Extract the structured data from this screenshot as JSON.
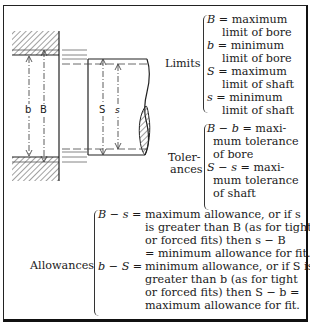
{
  "drawing": {
    "bore_labels": {
      "b": "b",
      "B": "B"
    },
    "shaft_labels": {
      "S": "S",
      "s": "s"
    }
  },
  "limits": {
    "label": "Limits",
    "items": [
      {
        "sym": "B",
        "line1": "= maximum",
        "line2": "limit of bore"
      },
      {
        "sym": "b",
        "line1": "= minimum",
        "line2": "limit of bore"
      },
      {
        "sym": "S",
        "line1": "= maximum",
        "line2": "limit of shaft"
      },
      {
        "sym": "s",
        "line1": "= minimum",
        "line2": "limit of shaft"
      }
    ]
  },
  "tolerances": {
    "label_line1": "Toler-",
    "label_line2": "ances",
    "items": [
      {
        "expr": "B − b",
        "line1": " = maxi-",
        "line2": "mum tolerance",
        "line3": "of bore"
      },
      {
        "expr": "S − s",
        "line1": " = maxi-",
        "line2": "mum tolerance",
        "line3": "of shaft"
      }
    ]
  },
  "allowances": {
    "label": "Allowances",
    "items": [
      {
        "expr": "B − s =",
        "lines": [
          "maximum allowance, or if s",
          "is greater than B (as for tight",
          "or forced fits) then s − B",
          "= minimum allowance for fit."
        ]
      },
      {
        "expr": "b − S =",
        "lines": [
          "minimum allowance, or if S is",
          "greater than b (as for tight",
          "or forced fits) then S − b =",
          "maximum allowance for fit."
        ]
      }
    ]
  }
}
